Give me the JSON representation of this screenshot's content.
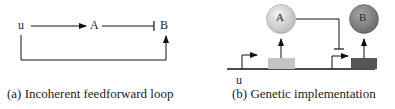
{
  "panel_a": {
    "caption": "(a) Incoherent feedforward loop",
    "nodes": {
      "u": "u",
      "A": "A",
      "B": "B"
    },
    "edges": [
      {
        "from": "u",
        "to": "A",
        "type": "activation"
      },
      {
        "from": "A",
        "to": "B",
        "type": "repression"
      },
      {
        "from": "u",
        "to": "B",
        "type": "activation"
      }
    ]
  },
  "panel_b": {
    "caption": "(b) Genetic implementation",
    "input_label": "u",
    "protein_a": {
      "label": "A",
      "color": "#d6d6d6"
    },
    "protein_b": {
      "label": "B",
      "color": "#8a8a8a"
    },
    "gene_a_color": "#c4c4c4",
    "gene_b_color": "#555555"
  }
}
